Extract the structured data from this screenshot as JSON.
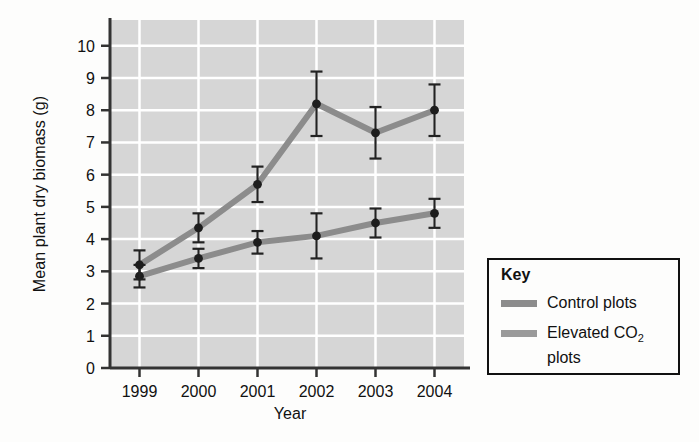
{
  "chart_data": {
    "type": "line",
    "title": "",
    "xlabel": "Year",
    "ylabel": "Mean plant dry biomass (g)",
    "categories": [
      "1999",
      "2000",
      "2001",
      "2002",
      "2003",
      "2004"
    ],
    "x": [
      1999,
      2000,
      2001,
      2002,
      2003,
      2004
    ],
    "ylim": [
      0,
      10.8
    ],
    "yticks": [
      0,
      1,
      2,
      3,
      4,
      5,
      6,
      7,
      8,
      9,
      10
    ],
    "ytick_labels": [
      "0",
      "1",
      "2",
      "3",
      "4",
      "5",
      "6",
      "7",
      "8",
      "9",
      "10"
    ],
    "grid": true,
    "grid_color": "#ffffff",
    "plot_background": "#d6d6d6",
    "legend_position": "right-outside",
    "error_bars": true,
    "series": [
      {
        "name": "Control plots",
        "color": "#8c8c8c",
        "values": [
          2.85,
          3.4,
          3.9,
          4.1,
          4.5,
          4.8
        ],
        "errors": [
          0.35,
          0.3,
          0.35,
          0.7,
          0.45,
          0.45
        ]
      },
      {
        "name": "Elevated CO2 plots",
        "color": "#8c8c8c",
        "values": [
          3.2,
          4.35,
          5.7,
          8.2,
          7.3,
          8.0
        ],
        "errors": [
          0.45,
          0.45,
          0.55,
          1.0,
          0.8,
          0.8
        ]
      }
    ]
  },
  "legend": {
    "title": "Key",
    "entries": [
      {
        "label": "Control plots",
        "color": "#8c8c8c"
      },
      {
        "label_part1": "Elevated CO",
        "label_sub": "2",
        "label_part2": " plots",
        "color": "#9a9a9a"
      }
    ]
  }
}
